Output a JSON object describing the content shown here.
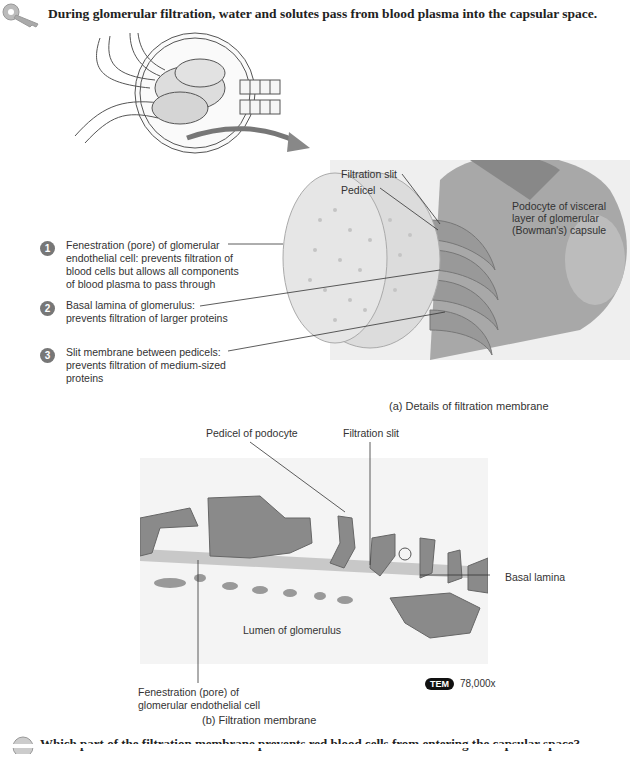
{
  "heading": "During glomerular filtration, water and solutes pass from blood plasma into the capsular space.",
  "panel_a": {
    "numbered_labels": [
      {
        "number": "1",
        "lines": [
          "Fenestration (pore) of glomerular",
          "endothelial cell: prevents filtration of",
          "blood cells but allows all components",
          "of blood plasma to pass through"
        ]
      },
      {
        "number": "2",
        "lines": [
          "Basal lamina of glomerulus:",
          "prevents filtration of larger proteins"
        ]
      },
      {
        "number": "3",
        "lines": [
          "Slit membrane between pedicels:",
          "prevents filtration of medium-sized",
          "proteins"
        ]
      }
    ],
    "filtration_slit": "Filtration slit",
    "pedicel": "Pedicel",
    "podocyte_lines": [
      "Podocyte of visceral",
      "layer of glomerular",
      "(Bowman's) capsule"
    ],
    "caption": "(a) Details of filtration membrane"
  },
  "panel_b": {
    "pedicel_of_podocyte": "Pedicel of podocyte",
    "filtration_slit": "Filtration slit",
    "basal_lamina": "Basal lamina",
    "lumen": "Lumen of glomerulus",
    "fenestration_lines": [
      "Fenestration (pore) of",
      "glomerular endothelial cell"
    ],
    "tem_badge": "TEM",
    "magnification": "78,000x",
    "caption": "(b) Filtration membrane"
  },
  "question": "Which part of the filtration membrane prevents red blood cells from entering the capsular space?",
  "icons": {
    "key": "key-icon",
    "question": "question-icon"
  }
}
